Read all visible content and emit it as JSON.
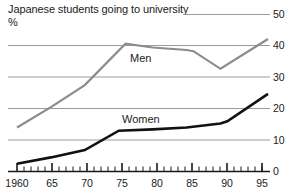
{
  "chart_data": {
    "type": "line",
    "title": "Japanese students going to university",
    "subtitle": "",
    "ylabel": "%",
    "xlabel": "",
    "ylim": [
      0,
      50
    ],
    "xlim": [
      1960,
      1997
    ],
    "grid": true,
    "gridlines": [
      10,
      20,
      30,
      40,
      50
    ],
    "y_ticks": [
      "50",
      "40",
      "30",
      "20",
      "10",
      "0"
    ],
    "y_tick_values": [
      50,
      40,
      30,
      20,
      10,
      0
    ],
    "x_ticks": [
      "1960",
      "65",
      "70",
      "75",
      "80",
      "85",
      "90",
      "95"
    ],
    "x_tick_values": [
      1960,
      1965,
      1970,
      1975,
      1980,
      1985,
      1990,
      1995
    ],
    "x_minor_tick_step": 1,
    "legend_position": "inline-labels",
    "series": [
      {
        "name": "Men",
        "color": "#8c8c8c",
        "x": [
          1960,
          1965,
          1970,
          1976,
          1980,
          1985,
          1986,
          1990,
          1997
        ],
        "values": [
          14.0,
          20.5,
          27.5,
          40.7,
          39.5,
          38.7,
          38.3,
          32.7,
          42.2
        ]
      },
      {
        "name": "Women",
        "color": "#111111",
        "x": [
          1960,
          1965,
          1970,
          1975,
          1980,
          1985,
          1990,
          1991,
          1997
        ],
        "values": [
          2.5,
          4.5,
          6.8,
          13.0,
          13.4,
          14.0,
          15.3,
          16.0,
          24.7
        ]
      }
    ],
    "colors": {
      "men_line": "#8c8c8c",
      "women_line": "#111111",
      "gridline": "#9b9b9b",
      "axis": "#1a1a1a",
      "background": "#ffffff",
      "text": "#1a1a1a"
    }
  }
}
